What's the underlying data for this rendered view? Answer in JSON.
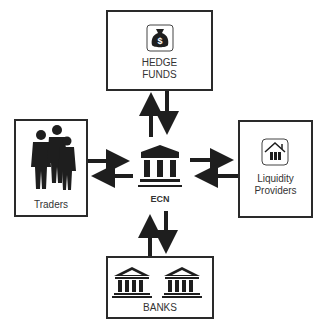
{
  "nodes": {
    "hedge_funds": {
      "line1": "HEDGE",
      "line2": "FUNDS",
      "icon": "money-bag-icon"
    },
    "traders": {
      "label": "Traders",
      "icon": "people-icon"
    },
    "liquidity_providers": {
      "line1": "Liquidity",
      "line2": "Providers",
      "icon": "house-icon"
    },
    "banks": {
      "label": "BANKS",
      "icon": "bank-building-icon"
    },
    "ecn": {
      "label": "ECN",
      "icon": "ecn-building-icon"
    }
  },
  "colors": {
    "stroke": "#2a2a2a",
    "fill": "#1e1e1e",
    "text": "#333333"
  }
}
